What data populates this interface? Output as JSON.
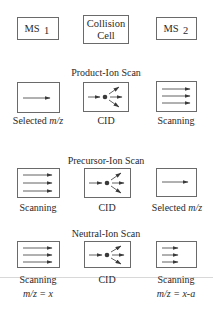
{
  "components": {
    "ms1": {
      "label": "MS",
      "sub": "1"
    },
    "collision_cell": {
      "line1": "Collision",
      "line2": "Cell"
    },
    "ms2": {
      "label": "MS",
      "sub": "2"
    }
  },
  "scans": [
    {
      "title": "Product-Ion Scan",
      "left": {
        "mode": "selected",
        "label_prefix": "Selected ",
        "label_italic": "m/z"
      },
      "center": {
        "mode": "cid",
        "label": "CID"
      },
      "right": {
        "mode": "scanning",
        "label": "Scanning"
      }
    },
    {
      "title": "Precursor-Ion Scan",
      "left": {
        "mode": "scanning",
        "label": "Scanning"
      },
      "center": {
        "mode": "cid",
        "label": "CID"
      },
      "right": {
        "mode": "selected",
        "label_prefix": "Selected ",
        "label_italic": "m/z"
      }
    },
    {
      "title": "Neutral-Ion Scan",
      "left": {
        "mode": "scanning",
        "label": "Scanning",
        "sublabel": "m/z = x"
      },
      "center": {
        "mode": "cid",
        "label": "CID"
      },
      "right": {
        "mode": "scanning-offset",
        "label": "Scanning",
        "sublabel": "m/z = x-a"
      }
    }
  ]
}
